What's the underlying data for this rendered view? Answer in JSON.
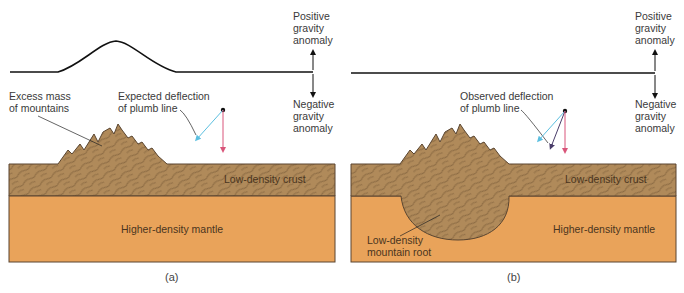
{
  "panels": [
    {
      "id": "a",
      "caption": "(a)",
      "gravity_label_positive": [
        "Positive",
        "gravity",
        "anomaly"
      ],
      "gravity_label_negative": [
        "Negative",
        "gravity",
        "anomaly"
      ],
      "mountain_label": [
        "Excess mass",
        "of mountains"
      ],
      "deflection_label": [
        "Expected deflection",
        "of plumb line"
      ],
      "crust_label": "Low-density crust",
      "mantle_label": "Higher-density mantle",
      "gravity_profile": "bump"
    },
    {
      "id": "b",
      "caption": "(b)",
      "gravity_label_positive": [
        "Positive",
        "gravity",
        "anomaly"
      ],
      "gravity_label_negative": [
        "Negative",
        "gravity",
        "anomaly"
      ],
      "deflection_label": [
        "Observed deflection",
        "of plumb line"
      ],
      "crust_label": "Low-density crust",
      "mantle_label": "Higher-density mantle",
      "root_label": [
        "Low-density",
        "mountain root"
      ],
      "gravity_profile": "flat"
    }
  ],
  "colors": {
    "crust": "#b08a5a",
    "mantle": "#e9a35a",
    "outline": "#5a4530",
    "expected_arrow": "#5bbfe0",
    "observed_arrow": "#4a3d6a",
    "vertical_arrow": "#d9557a"
  }
}
